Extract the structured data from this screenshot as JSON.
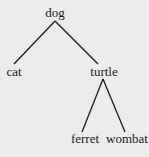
{
  "diagram": {
    "type": "tree",
    "nodes": [
      {
        "id": "dog",
        "label": "dog"
      },
      {
        "id": "cat",
        "label": "cat"
      },
      {
        "id": "turtle",
        "label": "turtle"
      },
      {
        "id": "ferret",
        "label": "ferret"
      },
      {
        "id": "wombat",
        "label": "wombat"
      }
    ],
    "edges": [
      {
        "from": "dog",
        "to": "cat"
      },
      {
        "from": "dog",
        "to": "turtle"
      },
      {
        "from": "turtle",
        "to": "ferret"
      },
      {
        "from": "turtle",
        "to": "wombat"
      }
    ],
    "line_color": "#1a1a1a",
    "background": "#ececec"
  }
}
